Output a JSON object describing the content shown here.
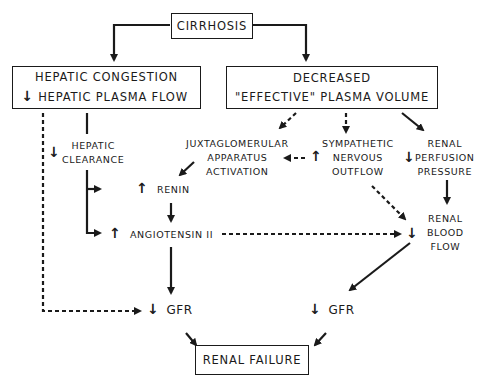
{
  "diagram": {
    "nodes": {
      "cirrhosis": "CIRRHOSIS",
      "hepatic_congestion": {
        "line1": "HEPATIC  CONGESTION",
        "line2_arrow": "↓",
        "line2": "HEPATIC  PLASMA  FLOW"
      },
      "decreased_volume": {
        "line1": "DECREASED",
        "line2": "\"EFFECTIVE\"  PLASMA  VOLUME"
      },
      "hepatic_clearance": {
        "arrow": "↓",
        "line1": "HEPATIC",
        "line2": "CLEARANCE"
      },
      "juxtaglomerular": {
        "line1": "JUXTAGLOMERULAR",
        "line2": "APPARATUS",
        "line3": "ACTIVATION"
      },
      "sympathetic": {
        "arrow": "↑",
        "line1": "SYMPATHETIC",
        "line2": "NERVOUS",
        "line3": "OUTFLOW"
      },
      "renal_perfusion": {
        "arrow": "↓",
        "line1": "RENAL",
        "line2": "PERFUSION",
        "line3": "PRESSURE"
      },
      "renin": {
        "arrow": "↑",
        "label": "RENIN"
      },
      "angiotensin": {
        "arrow": "↑",
        "label": "ANGIOTENSIN  II"
      },
      "renal_blood_flow": {
        "arrow": "↓",
        "line1": "RENAL",
        "line2": "BLOOD",
        "line3": "FLOW"
      },
      "gfr_left": {
        "arrow": "↓",
        "label": "GFR"
      },
      "gfr_right": {
        "arrow": "↓",
        "label": "GFR"
      },
      "renal_failure": "RENAL  FAILURE"
    },
    "edges": [
      {
        "from": "cirrhosis",
        "to": "hepatic_congestion",
        "style": "solid"
      },
      {
        "from": "cirrhosis",
        "to": "decreased_volume",
        "style": "solid"
      },
      {
        "from": "hepatic_congestion",
        "to": "hepatic_clearance",
        "style": "solid"
      },
      {
        "from": "hepatic_congestion",
        "to": "gfr_left",
        "style": "dashed"
      },
      {
        "from": "hepatic_clearance",
        "to": "renin",
        "style": "solid"
      },
      {
        "from": "hepatic_clearance",
        "to": "angiotensin",
        "style": "solid"
      },
      {
        "from": "decreased_volume",
        "to": "juxtaglomerular",
        "style": "dashed"
      },
      {
        "from": "decreased_volume",
        "to": "sympathetic",
        "style": "dashed"
      },
      {
        "from": "decreased_volume",
        "to": "renal_perfusion",
        "style": "solid"
      },
      {
        "from": "sympathetic",
        "to": "juxtaglomerular",
        "style": "dashed"
      },
      {
        "from": "sympathetic",
        "to": "renal_blood_flow",
        "style": "dashed"
      },
      {
        "from": "juxtaglomerular",
        "to": "renin",
        "style": "solid"
      },
      {
        "from": "renin",
        "to": "angiotensin",
        "style": "solid"
      },
      {
        "from": "angiotensin",
        "to": "renal_blood_flow",
        "style": "dashed"
      },
      {
        "from": "angiotensin",
        "to": "gfr_left",
        "style": "solid"
      },
      {
        "from": "renal_perfusion",
        "to": "renal_blood_flow",
        "style": "solid"
      },
      {
        "from": "renal_blood_flow",
        "to": "gfr_right",
        "style": "solid"
      },
      {
        "from": "gfr_left",
        "to": "renal_failure",
        "style": "solid"
      },
      {
        "from": "gfr_right",
        "to": "renal_failure",
        "style": "solid"
      }
    ]
  }
}
